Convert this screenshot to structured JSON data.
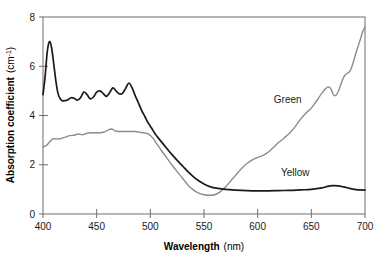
{
  "chart_data": {
    "type": "line",
    "title": "",
    "xlabel": "Wavelength",
    "xlabel_unit": "(nm)",
    "ylabel": "Absorption coefficient",
    "ylabel_unit": "(cm",
    "ylabel_unit_sup": "-1",
    "ylabel_unit_close": ")",
    "xlim": [
      400,
      700
    ],
    "ylim": [
      0,
      8
    ],
    "xticks": [
      400,
      450,
      500,
      550,
      600,
      650,
      700
    ],
    "xtick_labels": [
      "400",
      "450",
      "500",
      "550",
      "600",
      "650",
      "700"
    ],
    "yticks": [
      0,
      2,
      4,
      6,
      8
    ],
    "ytick_labels": [
      "0",
      "2",
      "4",
      "6",
      "8"
    ],
    "grid": false,
    "legend_position": "inline-annotations",
    "colors": {
      "yellow_series": "#1a1a1a",
      "green_series": "#8c8c8c",
      "frame": "#6e6e6e",
      "text": "#1a1a1a"
    },
    "annotations": [
      {
        "text": "Green",
        "x": 628,
        "y": 4.5
      },
      {
        "text": "Yellow",
        "x": 635,
        "y": 1.55
      }
    ],
    "series": [
      {
        "name": "Yellow",
        "color": "#1a1a1a",
        "x": [
          400,
          402,
          404,
          406,
          408,
          410,
          412,
          414,
          416,
          418,
          420,
          423,
          426,
          429,
          432,
          435,
          438,
          441,
          444,
          447,
          450,
          453,
          456,
          459,
          462,
          465,
          468,
          471,
          474,
          477,
          480,
          483,
          486,
          489,
          492,
          495,
          498,
          501,
          505,
          510,
          515,
          520,
          525,
          530,
          535,
          540,
          545,
          550,
          555,
          560,
          570,
          580,
          590,
          600,
          610,
          620,
          630,
          640,
          650,
          660,
          665,
          670,
          675,
          680,
          685,
          690,
          695,
          700
        ],
        "y": [
          4.85,
          5.6,
          6.6,
          7.0,
          6.75,
          6.1,
          5.4,
          4.9,
          4.68,
          4.6,
          4.6,
          4.63,
          4.72,
          4.7,
          4.62,
          4.72,
          4.95,
          4.85,
          4.68,
          4.75,
          4.95,
          5.0,
          4.9,
          4.78,
          4.92,
          5.12,
          5.0,
          4.88,
          4.9,
          5.1,
          5.32,
          5.12,
          4.8,
          4.5,
          4.2,
          3.95,
          3.7,
          3.5,
          3.22,
          2.95,
          2.68,
          2.42,
          2.18,
          1.95,
          1.72,
          1.52,
          1.35,
          1.22,
          1.12,
          1.06,
          1.0,
          0.97,
          0.95,
          0.94,
          0.94,
          0.95,
          0.96,
          0.98,
          1.0,
          1.06,
          1.12,
          1.15,
          1.14,
          1.1,
          1.05,
          1.0,
          0.98,
          0.97
        ]
      },
      {
        "name": "Green",
        "color": "#8c8c8c",
        "x": [
          400,
          403,
          406,
          409,
          412,
          415,
          418,
          421,
          425,
          429,
          433,
          437,
          441,
          445,
          449,
          453,
          457,
          461,
          464,
          467,
          470,
          474,
          478,
          482,
          486,
          490,
          494,
          498,
          502,
          506,
          510,
          515,
          520,
          525,
          530,
          535,
          540,
          545,
          550,
          555,
          560,
          565,
          570,
          575,
          580,
          585,
          590,
          595,
          600,
          605,
          610,
          615,
          620,
          625,
          630,
          635,
          640,
          645,
          650,
          655,
          660,
          665,
          668,
          671,
          674,
          677,
          680,
          683,
          686,
          689,
          692,
          695,
          698,
          700
        ],
        "y": [
          2.72,
          2.78,
          2.92,
          3.05,
          3.05,
          3.05,
          3.08,
          3.12,
          3.18,
          3.2,
          3.25,
          3.22,
          3.28,
          3.3,
          3.3,
          3.3,
          3.33,
          3.42,
          3.45,
          3.38,
          3.35,
          3.35,
          3.35,
          3.35,
          3.35,
          3.32,
          3.3,
          3.25,
          3.1,
          2.85,
          2.6,
          2.3,
          2.0,
          1.72,
          1.45,
          1.18,
          0.98,
          0.85,
          0.78,
          0.76,
          0.78,
          0.9,
          1.1,
          1.35,
          1.6,
          1.85,
          2.05,
          2.2,
          2.3,
          2.38,
          2.52,
          2.72,
          2.92,
          3.1,
          3.3,
          3.55,
          3.85,
          4.1,
          4.3,
          4.6,
          4.92,
          5.15,
          5.1,
          4.82,
          4.88,
          5.2,
          5.55,
          5.7,
          5.8,
          6.15,
          6.6,
          7.0,
          7.42,
          7.6
        ]
      }
    ]
  }
}
